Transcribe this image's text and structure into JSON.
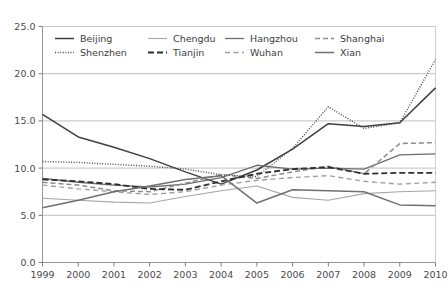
{
  "chart_data": {
    "type": "line",
    "title": "",
    "xlabel": "",
    "ylabel": "",
    "x": [
      1999,
      2000,
      2001,
      2002,
      2003,
      2004,
      2005,
      2006,
      2007,
      2008,
      2009,
      2010
    ],
    "xticklabels": [
      "1999",
      "2000",
      "2001",
      "2002",
      "2003",
      "2004",
      "2005",
      "2006",
      "2007",
      "2008",
      "2009",
      "2010"
    ],
    "yticklabels": [
      "0.0",
      "5.0",
      "10.0",
      "15.0",
      "20.0",
      "25.0"
    ],
    "yticks": [
      0,
      5,
      10,
      15,
      20,
      25
    ],
    "ylim": [
      0,
      25
    ],
    "xlim": [
      1999,
      2010
    ],
    "grid": true,
    "legend_position": "top-inside",
    "legend_columns": 4,
    "series": [
      {
        "name": "Beijing",
        "style": "solid",
        "color": "#3f3f3f",
        "width": 1.5,
        "values": [
          15.7,
          13.3,
          12.2,
          11.0,
          9.6,
          8.3,
          9.8,
          12.0,
          14.7,
          14.4,
          14.8,
          18.5
        ]
      },
      {
        "name": "Chengdu",
        "style": "solid",
        "color": "#a6a6a6",
        "width": 1.1,
        "values": [
          6.8,
          6.6,
          6.4,
          6.3,
          7.0,
          7.6,
          8.1,
          6.9,
          6.6,
          7.3,
          7.5,
          7.6
        ]
      },
      {
        "name": "Hangzhou",
        "style": "solid",
        "color": "#6e6e6e",
        "width": 1.3,
        "values": [
          8.9,
          8.5,
          8.2,
          8.0,
          8.3,
          9.0,
          10.3,
          9.9,
          10.0,
          9.9,
          11.4,
          11.5
        ]
      },
      {
        "name": "Shanghai",
        "style": "dashed",
        "color": "#8c8c8c",
        "width": 1.5,
        "values": [
          8.5,
          8.2,
          7.6,
          7.5,
          8.4,
          9.3,
          8.9,
          9.6,
          10.2,
          9.4,
          12.6,
          12.7
        ]
      },
      {
        "name": "Shenzhen",
        "style": "dotted",
        "color": "#4a4a4a",
        "width": 1.4,
        "values": [
          10.7,
          10.6,
          10.4,
          10.2,
          9.9,
          9.3,
          9.1,
          12.1,
          16.5,
          14.2,
          14.8,
          21.5
        ]
      },
      {
        "name": "Tianjin",
        "style": "dashed-bold",
        "color": "#2e2e2e",
        "width": 1.8,
        "values": [
          8.8,
          8.6,
          8.3,
          7.8,
          7.7,
          8.6,
          9.4,
          9.9,
          10.1,
          9.4,
          9.5,
          9.5
        ]
      },
      {
        "name": "Wuhan",
        "style": "dashed-light",
        "color": "#a0a0a0",
        "width": 1.4,
        "values": [
          8.2,
          7.8,
          7.5,
          7.2,
          7.5,
          8.2,
          8.7,
          9.0,
          9.2,
          8.6,
          8.3,
          8.5
        ]
      },
      {
        "name": "Xian",
        "style": "solid",
        "color": "#707070",
        "width": 1.5,
        "values": [
          5.8,
          6.6,
          7.5,
          8.1,
          8.8,
          9.2,
          6.3,
          7.7,
          7.6,
          7.5,
          6.1,
          6.0
        ]
      }
    ]
  },
  "legend": {
    "rows": [
      [
        "Beijing",
        "Chengdu",
        "Hangzhou",
        "Shanghai"
      ],
      [
        "Shenzhen",
        "Tianjin",
        "Wuhan",
        "Xian"
      ]
    ]
  }
}
